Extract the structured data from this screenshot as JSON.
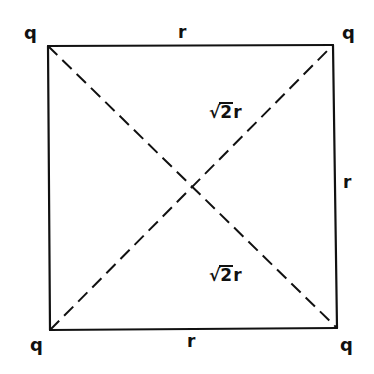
{
  "diagram": {
    "corners": [
      {
        "id": "top-left",
        "label": "q",
        "x": 48,
        "y": 46
      },
      {
        "id": "top-right",
        "label": "q",
        "x": 333,
        "y": 45
      },
      {
        "id": "bottom-left",
        "label": "q",
        "x": 50,
        "y": 330
      },
      {
        "id": "bottom-right",
        "label": "q",
        "x": 337,
        "y": 328
      }
    ],
    "sides": {
      "top": "r",
      "right": "r",
      "bottom": "r"
    },
    "diagonals": {
      "upper_label_root": "2",
      "upper_label_var": "r",
      "lower_label_root": "2",
      "lower_label_var": "r",
      "style": "dashed"
    },
    "colors": {
      "line": "#111111",
      "background": "#ffffff"
    }
  }
}
